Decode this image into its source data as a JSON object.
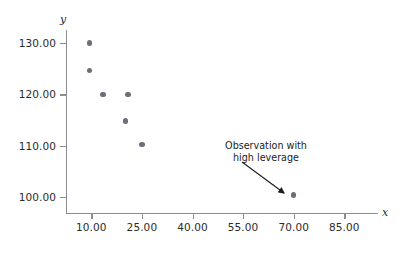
{
  "chart_data": {
    "type": "scatter",
    "title": "",
    "xlabel": "x",
    "ylabel": "y",
    "xlim": [
      2.5,
      95.0
    ],
    "ylim": [
      97.0,
      132.5
    ],
    "grid": false,
    "legend": null,
    "xticks": [
      "10.00",
      "25.00",
      "40.00",
      "55.00",
      "70.00",
      "85.00"
    ],
    "xtick_values": [
      10,
      25,
      40,
      55,
      70,
      85
    ],
    "yticks": [
      "100.00",
      "110.00",
      "120.00",
      "130.00"
    ],
    "ytick_values": [
      100,
      110,
      120,
      130
    ],
    "series": [
      {
        "name": "observations",
        "color": "#6b7078",
        "points": [
          {
            "x": 9.5,
            "y": 130.0
          },
          {
            "x": 9.5,
            "y": 124.6
          },
          {
            "x": 13.4,
            "y": 120.0
          },
          {
            "x": 20.9,
            "y": 120.0
          },
          {
            "x": 20.2,
            "y": 114.8
          },
          {
            "x": 25.0,
            "y": 110.2
          },
          {
            "x": 70.0,
            "y": 100.4
          }
        ]
      }
    ],
    "annotations": [
      {
        "text_line1": "Observation with",
        "text_line2": "high leverage",
        "points_to": {
          "x": 70.0,
          "y": 100.4
        }
      }
    ]
  },
  "axes": {
    "y_name": "y",
    "x_name": "x"
  },
  "annotation": {
    "line1": "Observation with",
    "line2": "high leverage"
  },
  "colors": {
    "marker": "#6b7078",
    "axis": "#8a8d91",
    "text": "#2b2b2b",
    "background": "#ffffff"
  }
}
